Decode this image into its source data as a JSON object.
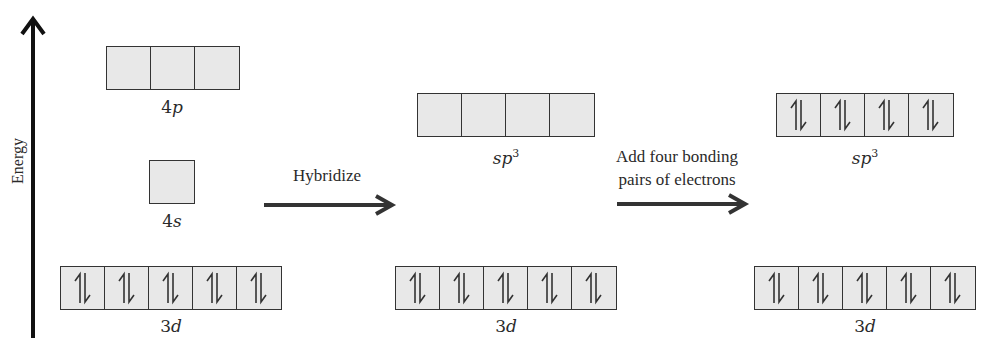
{
  "axis": {
    "label": "Energy",
    "direction": "up"
  },
  "stage1": {
    "p": {
      "num": "4",
      "sub": "p",
      "boxes": 3,
      "electrons": [
        "empty",
        "empty",
        "empty"
      ]
    },
    "s": {
      "num": "4",
      "sub": "s",
      "boxes": 1,
      "electrons": [
        "empty"
      ]
    },
    "d": {
      "num": "3",
      "sub": "d",
      "boxes": 5,
      "electrons": [
        "paired",
        "paired",
        "paired",
        "paired",
        "paired"
      ]
    }
  },
  "arrow1": {
    "label": "Hybridize"
  },
  "stage2": {
    "hybrid": {
      "prefix": "sp",
      "sup": "3",
      "boxes": 4,
      "electrons": [
        "empty",
        "empty",
        "empty",
        "empty"
      ]
    },
    "d": {
      "num": "3",
      "sub": "d",
      "boxes": 5,
      "electrons": [
        "paired",
        "paired",
        "paired",
        "paired",
        "paired"
      ]
    }
  },
  "arrow2": {
    "line1": "Add four bonding",
    "line2": "pairs of electrons"
  },
  "stage3": {
    "hybrid": {
      "prefix": "sp",
      "sup": "3",
      "boxes": 4,
      "electrons": [
        "paired",
        "paired",
        "paired",
        "paired"
      ]
    },
    "d": {
      "num": "3",
      "sub": "d",
      "boxes": 5,
      "electrons": [
        "paired",
        "paired",
        "paired",
        "paired",
        "paired"
      ]
    }
  },
  "colors": {
    "box_fill": "#e8e8e8",
    "line": "#333333",
    "arrow": "#333333"
  }
}
